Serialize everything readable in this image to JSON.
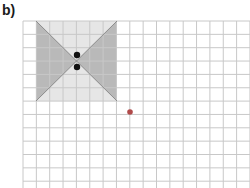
{
  "label": "b)",
  "grid": {
    "x0": 23,
    "y0": 21,
    "cell": 13.35,
    "cols": 17,
    "rows": 13,
    "line_color": "#c8c8c8"
  },
  "shape": {
    "square": {
      "x": 36,
      "y": 21,
      "w": 81,
      "h": 80,
      "fill": "#e6e6e6"
    },
    "left_triangle_fill": "#b9b9b9",
    "right_triangle_fill": "#b9b9b9",
    "edge_color": "#8c8c8c"
  },
  "points": [
    {
      "name": "black-dot-upper",
      "x": 77,
      "y": 55,
      "color": "#111111"
    },
    {
      "name": "black-dot-lower",
      "x": 77,
      "y": 67,
      "color": "#111111"
    },
    {
      "name": "red-dot",
      "x": 130,
      "y": 112,
      "color": "#b04a4a"
    }
  ]
}
